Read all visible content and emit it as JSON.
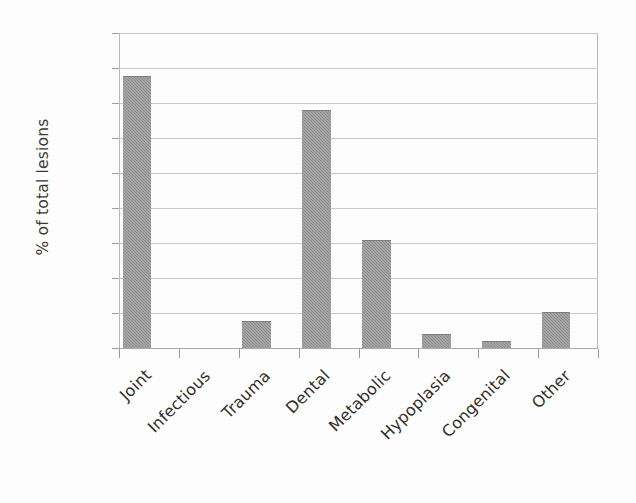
{
  "chart_data": {
    "type": "bar",
    "title": "",
    "subtitle": "",
    "xlabel": "",
    "ylabel": "% of total lesions",
    "categories": [
      "Joint",
      "Infectious",
      "Trauma",
      "Dental",
      "Metabolic",
      "Hypoplasia",
      "Congenital",
      "Other"
    ],
    "values": [
      38.8,
      0,
      3.9,
      34.0,
      15.4,
      2.0,
      1.0,
      5.2
    ],
    "ylim": [
      0,
      45
    ],
    "ytick_labels": [
      "45",
      "40",
      "35",
      "30",
      "25",
      "20",
      "15",
      "10",
      "5",
      "0"
    ],
    "ytick_values": [
      45,
      40,
      35,
      30,
      25,
      20,
      15,
      10,
      5,
      0
    ],
    "ytick_step": 5,
    "grid": "horizontal",
    "legend": "none",
    "bar_color": "#8c8c8c",
    "gridline_color": "#c9c9c9",
    "axis_color": "#aaaaaa",
    "text_color": "#2e2e2e",
    "background_color": "#ffffff",
    "xtick_label_rotation": -45
  }
}
